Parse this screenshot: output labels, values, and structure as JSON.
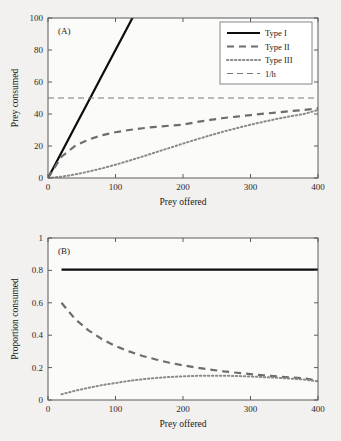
{
  "figure": {
    "background_color": "#f2f1ef",
    "panels": [
      "A",
      "B"
    ]
  },
  "chart_data": [
    {
      "type": "line",
      "panel_label": "(A)",
      "title": "",
      "xlabel": "Prey offered",
      "ylabel": "Prey consumed",
      "xlim": [
        0,
        400
      ],
      "ylim": [
        0,
        100
      ],
      "xticks": [
        0,
        100,
        200,
        300,
        400
      ],
      "yticks": [
        0,
        20,
        40,
        60,
        80,
        100
      ],
      "grid": false,
      "legend_position": "upper right",
      "x": [
        0,
        20,
        40,
        60,
        80,
        100,
        120,
        140,
        160,
        180,
        200,
        220,
        240,
        260,
        280,
        300,
        320,
        340,
        360,
        380,
        400
      ],
      "series": [
        {
          "name": "Type I",
          "style": "solid",
          "color": "#0d0d0d",
          "values": [
            0,
            16,
            32,
            48,
            64,
            80,
            96,
            112,
            null,
            null,
            null,
            null,
            null,
            null,
            null,
            null,
            null,
            null,
            null,
            null,
            null
          ]
        },
        {
          "name": "Type II",
          "style": "dashed",
          "color": "#6d6d6d",
          "values": [
            0,
            13.3,
            20.0,
            24.0,
            26.7,
            28.6,
            30.0,
            31.1,
            32.0,
            32.7,
            33.3,
            35.0,
            36.3,
            37.5,
            38.4,
            39.3,
            40.2,
            41.0,
            41.8,
            42.6,
            43.5
          ]
        },
        {
          "name": "Type III",
          "style": "dotted",
          "color": "#8a8a8a",
          "values": [
            0,
            0.8,
            2.2,
            4.0,
            6.0,
            8.3,
            10.8,
            13.4,
            16.1,
            18.8,
            21.5,
            24.1,
            26.6,
            29.0,
            31.2,
            33.3,
            35.2,
            37.0,
            38.6,
            40.1,
            42.5
          ]
        },
        {
          "name": "1/h",
          "style": "thin-dashed",
          "color": "#767676",
          "constant": 50,
          "values": [
            50,
            50,
            50,
            50,
            50,
            50,
            50,
            50,
            50,
            50,
            50,
            50,
            50,
            50,
            50,
            50,
            50,
            50,
            50,
            50,
            50
          ]
        }
      ]
    },
    {
      "type": "line",
      "panel_label": "(B)",
      "title": "",
      "xlabel": "Prey offered",
      "ylabel": "Proportion consumed",
      "xlim": [
        0,
        400
      ],
      "ylim": [
        0,
        1
      ],
      "xticks": [
        0,
        100,
        200,
        300,
        400
      ],
      "yticks": [
        0,
        0.2,
        0.4,
        0.6,
        0.8,
        1
      ],
      "grid": false,
      "legend_position": "none",
      "x": [
        20,
        40,
        60,
        80,
        100,
        120,
        140,
        160,
        180,
        200,
        220,
        240,
        260,
        280,
        300,
        320,
        340,
        360,
        380,
        400
      ],
      "series": [
        {
          "name": "Type I",
          "style": "solid",
          "color": "#0d0d0d",
          "constant": 0.805,
          "values": [
            0.805,
            0.805,
            0.805,
            0.805,
            0.805,
            0.805,
            0.805,
            0.805,
            0.805,
            0.805,
            0.805,
            0.805,
            0.805,
            0.805,
            0.805,
            0.805,
            0.805,
            0.805,
            0.805,
            0.805
          ]
        },
        {
          "name": "Type II",
          "style": "dashed",
          "color": "#6d6d6d",
          "values": [
            0.6,
            0.5,
            0.43,
            0.375,
            0.333,
            0.3,
            0.272,
            0.25,
            0.23,
            0.214,
            0.2,
            0.188,
            0.177,
            0.168,
            0.16,
            0.152,
            0.145,
            0.139,
            0.133,
            0.118
          ]
        },
        {
          "name": "Type III",
          "style": "dotted",
          "color": "#8a8a8a",
          "values": [
            0.035,
            0.057,
            0.075,
            0.092,
            0.105,
            0.118,
            0.128,
            0.136,
            0.142,
            0.146,
            0.149,
            0.15,
            0.15,
            0.148,
            0.145,
            0.141,
            0.137,
            0.132,
            0.126,
            0.115
          ]
        }
      ]
    }
  ],
  "legend": {
    "entries": [
      {
        "label": "Type I",
        "style": "solid"
      },
      {
        "label": "Type II",
        "style": "dashed"
      },
      {
        "label": "Type III",
        "style": "dotted"
      },
      {
        "label": "1/h",
        "style": "thin-dashed"
      }
    ]
  },
  "panel_a": {
    "label": "(A)",
    "xlabel": "Prey offered",
    "ylabel": "Prey consumed",
    "xticks": [
      "0",
      "100",
      "200",
      "300",
      "400"
    ],
    "yticks": [
      "0",
      "20",
      "40",
      "60",
      "80",
      "100"
    ]
  },
  "panel_b": {
    "label": "(B)",
    "xlabel": "Prey offered",
    "ylabel": "Proportion consumed",
    "xticks": [
      "0",
      "100",
      "200",
      "300",
      "400"
    ],
    "yticks": [
      "0",
      "0.2",
      "0.4",
      "0.6",
      "0.8",
      "1"
    ]
  }
}
